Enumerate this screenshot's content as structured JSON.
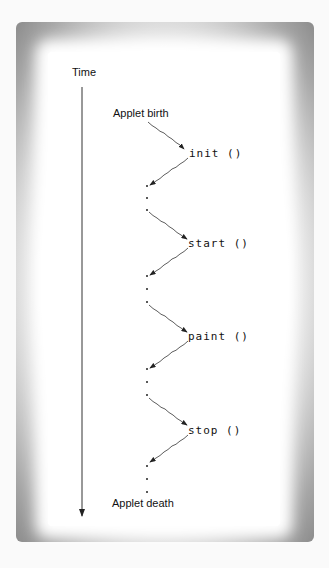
{
  "diagram": {
    "axis_label": "Time",
    "start_label": "Applet birth",
    "end_label": "Applet death",
    "methods": [
      {
        "label": "init ()"
      },
      {
        "label": "start ()"
      },
      {
        "label": "paint ()"
      },
      {
        "label": "stop ()"
      }
    ],
    "ellipsis": "."
  }
}
